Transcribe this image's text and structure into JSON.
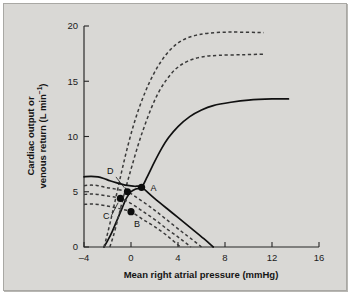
{
  "figure": {
    "background_color": "#d9d8d5",
    "border_color": "#a9a8a4"
  },
  "chart_data": {
    "type": "line",
    "title": "",
    "xlabel": "Mean right atrial pressure (mmHg)",
    "ylabel_line1": "Cardiac output or",
    "ylabel_line2_prefix": "venous return (L min",
    "ylabel_line2_sup": "−1",
    "ylabel_line2_suffix": ")",
    "ylabel_full": "Cardiac output or venous return (L min−1)",
    "xlim": [
      -4,
      16
    ],
    "ylim": [
      0,
      20
    ],
    "xticks": [
      -4,
      0,
      4,
      8,
      12,
      16
    ],
    "xtick_labels": [
      "–4",
      "0",
      "4",
      "8",
      "12",
      "16"
    ],
    "yticks": [
      0,
      5,
      10,
      15,
      20
    ],
    "ytick_labels": [
      "0",
      "5",
      "10",
      "15",
      "20"
    ],
    "grid": false,
    "legend": "none",
    "series": [
      {
        "name": "cardiac-function-normal",
        "style": "solid",
        "role": "cardiac output curve (normal contractility)",
        "plateau": 13.4,
        "x_intercept": -2.3,
        "points": [
          [
            -2.3,
            0.0
          ],
          [
            -2.0,
            0.55
          ],
          [
            -1.6,
            1.4
          ],
          [
            -1.2,
            2.4
          ],
          [
            -0.8,
            3.4
          ],
          [
            -0.4,
            4.4
          ],
          [
            0.0,
            5.0
          ],
          [
            0.4,
            5.25
          ],
          [
            0.9,
            5.4
          ],
          [
            1.4,
            6.4
          ],
          [
            2.0,
            7.7
          ],
          [
            2.6,
            8.9
          ],
          [
            3.2,
            9.9
          ],
          [
            4.0,
            10.9
          ],
          [
            5.0,
            11.8
          ],
          [
            6.0,
            12.4
          ],
          [
            7.0,
            12.8
          ],
          [
            8.5,
            13.1
          ],
          [
            10.0,
            13.3
          ],
          [
            12.0,
            13.4
          ],
          [
            13.4,
            13.4
          ]
        ]
      },
      {
        "name": "cardiac-function-enhanced-1",
        "style": "dashed",
        "role": "cardiac output curve (increased contractility, moderate)",
        "plateau": 17.4,
        "x_intercept": -1.8,
        "points": [
          [
            -1.8,
            0.0
          ],
          [
            -1.5,
            1.0
          ],
          [
            -1.1,
            2.6
          ],
          [
            -0.7,
            4.3
          ],
          [
            -0.3,
            5.9
          ],
          [
            0.1,
            7.4
          ],
          [
            0.6,
            9.2
          ],
          [
            1.1,
            10.8
          ],
          [
            1.7,
            12.5
          ],
          [
            2.3,
            13.9
          ],
          [
            3.0,
            15.1
          ],
          [
            3.8,
            16.1
          ],
          [
            4.8,
            16.8
          ],
          [
            6.0,
            17.2
          ],
          [
            7.5,
            17.35
          ],
          [
            9.5,
            17.4
          ],
          [
            11.3,
            17.45
          ]
        ]
      },
      {
        "name": "cardiac-function-enhanced-2",
        "style": "dashed",
        "role": "cardiac output curve (increased contractility, maximal)",
        "plateau": 19.4,
        "x_intercept": -2.3,
        "points": [
          [
            -2.3,
            0.0
          ],
          [
            -2.0,
            1.2
          ],
          [
            -1.6,
            3.0
          ],
          [
            -1.2,
            4.9
          ],
          [
            -0.8,
            6.8
          ],
          [
            -0.4,
            8.6
          ],
          [
            0.1,
            10.6
          ],
          [
            0.6,
            12.3
          ],
          [
            1.2,
            14.0
          ],
          [
            1.8,
            15.4
          ],
          [
            2.5,
            16.7
          ],
          [
            3.3,
            17.8
          ],
          [
            4.2,
            18.6
          ],
          [
            5.3,
            19.1
          ],
          [
            6.6,
            19.35
          ],
          [
            8.5,
            19.45
          ],
          [
            11.3,
            19.4
          ]
        ]
      },
      {
        "name": "venous-return-normal",
        "style": "solid",
        "role": "venous return curve (normal blood volume)",
        "plateau": 6.4,
        "mean_systemic_filling_pressure": 7.0,
        "points": [
          [
            -4.0,
            6.35
          ],
          [
            -3.4,
            6.4
          ],
          [
            -2.8,
            6.35
          ],
          [
            -2.3,
            6.2
          ],
          [
            -1.8,
            6.0
          ],
          [
            -1.2,
            5.8
          ],
          [
            -0.5,
            5.6
          ],
          [
            0.3,
            5.5
          ],
          [
            0.9,
            5.4
          ],
          [
            2.0,
            4.4
          ],
          [
            3.5,
            3.1
          ],
          [
            5.0,
            1.8
          ],
          [
            6.2,
            0.75
          ],
          [
            7.0,
            0.0
          ]
        ]
      },
      {
        "name": "venous-return-dashed-1",
        "style": "dashed",
        "role": "venous return curve (reduced volume, level 1)",
        "plateau": 5.6,
        "mean_systemic_filling_pressure": 6.0,
        "points": [
          [
            -4.0,
            5.55
          ],
          [
            -3.4,
            5.6
          ],
          [
            -2.8,
            5.55
          ],
          [
            -2.2,
            5.4
          ],
          [
            -1.6,
            5.3
          ],
          [
            -0.9,
            5.15
          ],
          [
            -0.3,
            5.0
          ],
          [
            0.6,
            4.4
          ],
          [
            1.8,
            3.5
          ],
          [
            3.0,
            2.5
          ],
          [
            4.3,
            1.4
          ],
          [
            5.3,
            0.6
          ],
          [
            6.0,
            0.0
          ]
        ]
      },
      {
        "name": "venous-return-dashed-2",
        "style": "dashed",
        "role": "venous return curve (reduced volume, level 2)",
        "plateau": 4.8,
        "mean_systemic_filling_pressure": 5.1,
        "points": [
          [
            -4.0,
            4.75
          ],
          [
            -3.4,
            4.8
          ],
          [
            -2.8,
            4.75
          ],
          [
            -2.2,
            4.65
          ],
          [
            -1.6,
            4.55
          ],
          [
            -0.9,
            4.4
          ],
          [
            -0.1,
            4.0
          ],
          [
            0.9,
            3.3
          ],
          [
            2.0,
            2.5
          ],
          [
            3.1,
            1.6
          ],
          [
            4.2,
            0.75
          ],
          [
            5.1,
            0.0
          ]
        ]
      },
      {
        "name": "venous-return-dashed-3",
        "style": "dashed",
        "role": "venous return curve (reduced volume, level 3)",
        "plateau": 3.9,
        "mean_systemic_filling_pressure": 4.2,
        "points": [
          [
            -4.0,
            3.85
          ],
          [
            -3.4,
            3.9
          ],
          [
            -2.8,
            3.85
          ],
          [
            -2.2,
            3.75
          ],
          [
            -1.5,
            3.6
          ],
          [
            -0.7,
            3.4
          ],
          [
            0.0,
            3.2
          ],
          [
            1.0,
            2.5
          ],
          [
            2.0,
            1.85
          ],
          [
            3.1,
            1.0
          ],
          [
            4.2,
            0.0
          ]
        ]
      }
    ],
    "annotations": [
      {
        "label": "A",
        "x": 0.9,
        "y": 5.4,
        "marker": "filled-circle",
        "label_dx": 9,
        "label_dy": 4,
        "leader": false
      },
      {
        "label": "D",
        "x": -0.3,
        "y": 5.0,
        "marker": "filled-circle",
        "label_dx": -14,
        "label_dy": -18,
        "leader": true
      },
      {
        "label": "C",
        "x": -0.9,
        "y": 4.4,
        "marker": "filled-circle",
        "label_dx": -11,
        "label_dy": 21,
        "leader": true
      },
      {
        "label": "B",
        "x": 0.0,
        "y": 3.2,
        "marker": "filled-circle",
        "label_dx": 3,
        "label_dy": 15,
        "leader": false
      }
    ]
  }
}
